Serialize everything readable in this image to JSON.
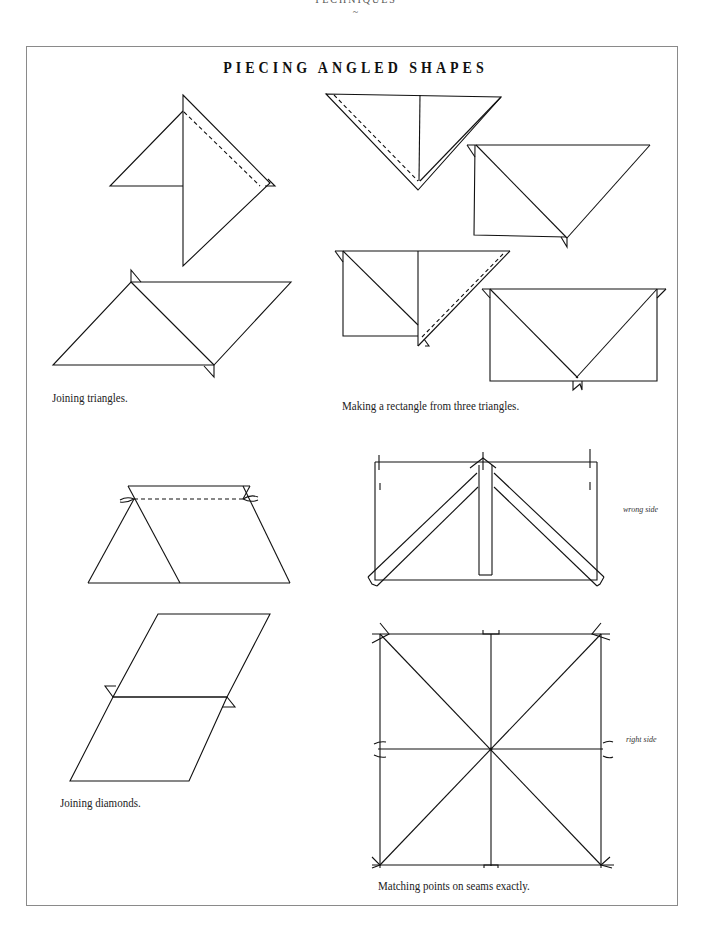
{
  "page": {
    "running_head": "TECHNIQUES",
    "running_ornament": "~",
    "title": "PIECING ANGLED SHAPES"
  },
  "figures": {
    "joining_triangles": {
      "caption": "Joining triangles."
    },
    "rectangle_from_triangles": {
      "caption": "Making a rectangle from three triangles."
    },
    "joining_diamonds": {
      "caption": "Joining diamonds."
    },
    "matching_points": {
      "caption": "Matching points on seams exactly.",
      "label_wrong_side": "wrong side",
      "label_right_side": "right side"
    }
  }
}
